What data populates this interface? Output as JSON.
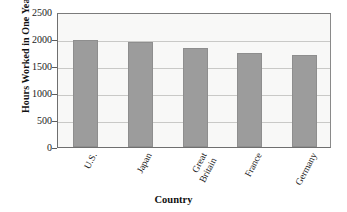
{
  "chart_data": {
    "type": "bar",
    "title": "",
    "xlabel": "Country",
    "ylabel": "Hours Worked in One Year",
    "categories": [
      "U.S.",
      "Japan",
      "Great\nBritain",
      "France",
      "Germany"
    ],
    "values": [
      1990,
      1950,
      1840,
      1750,
      1710
    ],
    "ylim": [
      0,
      2500
    ],
    "yticks": [
      0,
      500,
      1000,
      1500,
      2000,
      2500
    ],
    "ytick_labels": [
      "0",
      "500",
      "1000",
      "1500",
      "2000",
      "2500"
    ],
    "grid": true,
    "legend": "none",
    "bar_color": "#9c9c9c",
    "plot_background": "#f8f8f7",
    "axis_color": "#6f6f6f",
    "gridline_color": "#c9c9c7"
  }
}
